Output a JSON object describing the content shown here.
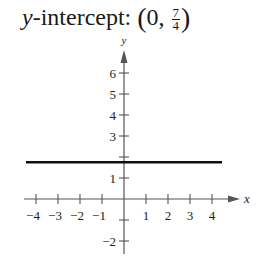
{
  "title": {
    "variable": "y",
    "label_rest": "-intercept:",
    "point_x": "0",
    "point_y_numerator": "7",
    "point_y_denominator": "4"
  },
  "chart_data": {
    "type": "line",
    "xlabel": "x",
    "ylabel": "y",
    "xlim": [
      -4.5,
      5
    ],
    "ylim": [
      -2.5,
      7
    ],
    "x_ticks": [
      -4,
      -3,
      -2,
      -1,
      1,
      2,
      3,
      4
    ],
    "x_tick_labels": [
      "−4",
      "−3",
      "−2",
      "−1",
      "1",
      "2",
      "3",
      "4"
    ],
    "y_ticks": [
      -2,
      -1,
      1,
      2,
      3,
      4,
      5,
      6
    ],
    "y_tick_labels": {
      "-2": "−2",
      "1": "1",
      "3": "3",
      "4": "4",
      "5": "5",
      "6": "6"
    },
    "grid": false,
    "series": [
      {
        "name": "y = 7/4",
        "x": [
          -4.5,
          4.5
        ],
        "y": [
          1.75,
          1.75
        ],
        "color": "#111111"
      }
    ],
    "annotations": [
      "y-intercept: (0, 7/4)"
    ]
  },
  "colors": {
    "axis": "#555555",
    "line": "#111111",
    "text": "#1a1a1a"
  }
}
